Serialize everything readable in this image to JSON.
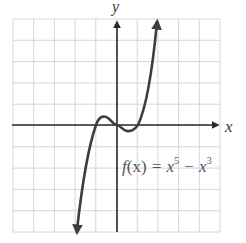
{
  "chart_data": {
    "type": "line",
    "title": "",
    "xlabel": "x",
    "ylabel": "y",
    "function_label": "f(x) = x^5 − x^3",
    "grid": true,
    "grid_cells": {
      "columns": 10,
      "rows": 10
    },
    "xlim": [
      -5,
      5
    ],
    "ylim": [
      -5,
      5
    ],
    "axis_arrows": {
      "x": "right",
      "y": "up"
    },
    "curve_end_arrows": [
      "up",
      "down"
    ],
    "series": [
      {
        "name": "f(x) = x^5 - x^3",
        "x": [
          -1.9,
          -1.5,
          -1.2,
          -1.0,
          -0.8,
          -0.6,
          -0.3,
          0,
          0.3,
          0.6,
          0.8,
          1.0,
          1.2,
          1.5,
          1.9
        ],
        "y": [
          -5,
          -3.5,
          -1.5,
          0,
          0.25,
          0.3,
          0.12,
          0,
          -0.12,
          -0.3,
          -0.25,
          0,
          1.5,
          3.5,
          5
        ]
      }
    ],
    "roots": [
      -1,
      0,
      1
    ],
    "local_max": {
      "x": -0.77,
      "y": 0.19
    },
    "local_min": {
      "x": 0.77,
      "y": -0.19
    }
  },
  "labels": {
    "x_axis": "x",
    "y_axis": "y",
    "fn_prefix": "f",
    "fn_paren": "(x)",
    "fn_eq": " = x",
    "fn_exp1": "5",
    "fn_minus": " − x",
    "fn_exp2": "3"
  },
  "colors": {
    "grid": "#d6d6d6",
    "axis": "#2a2a2a",
    "curve": "#3d3d3d",
    "text": "#4a4a4a"
  }
}
